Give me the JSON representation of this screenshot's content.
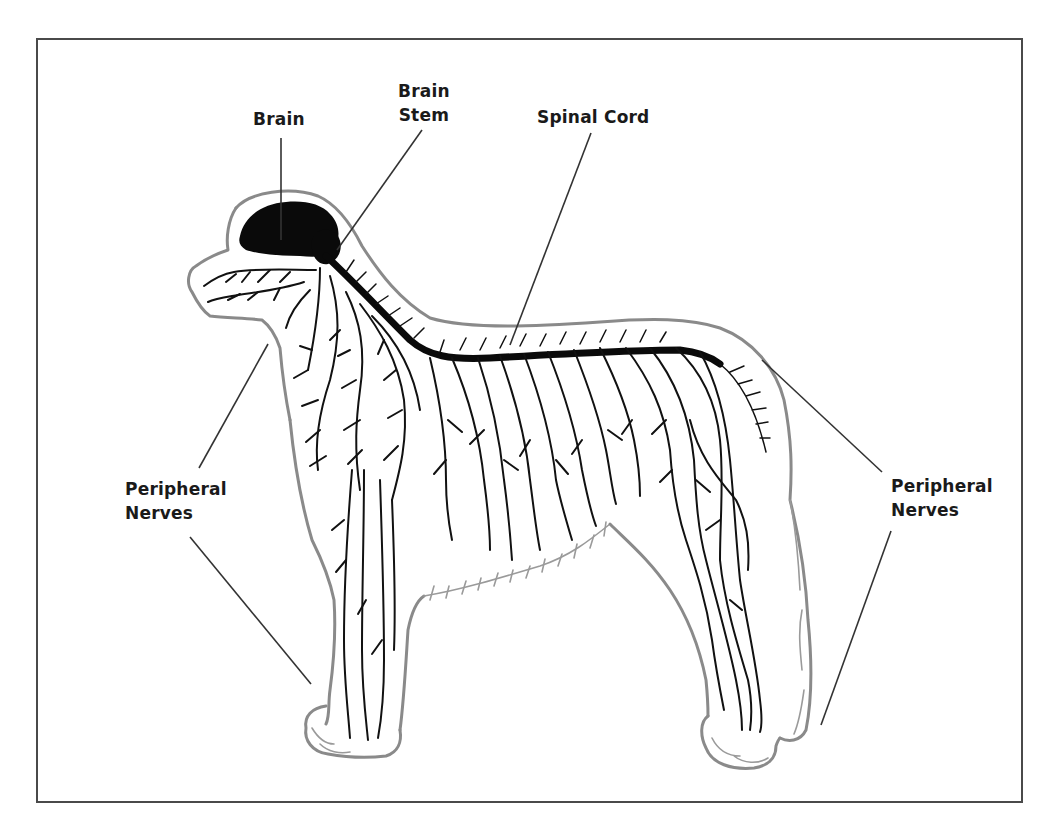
{
  "diagram": {
    "colors": {
      "frame": "#4a4a4a",
      "outline": "#8a8a8a",
      "nerves": "#111111",
      "brain": "#0a0a0a",
      "label_text": "#1a1a1a",
      "background": "#ffffff"
    },
    "labels": {
      "brain": "Brain",
      "brain_stem_line1": "Brain",
      "brain_stem_line2": "Stem",
      "spinal_cord": "Spinal Cord",
      "peripheral_left_line1": "Peripheral",
      "peripheral_left_line2": "Nerves",
      "peripheral_right_line1": "Peripheral",
      "peripheral_right_line2": "Nerves"
    },
    "leaders": [
      {
        "label": "Brain",
        "from": [
          281,
          138
        ],
        "to": [
          281,
          240
        ]
      },
      {
        "label": "Brain Stem",
        "from": [
          422,
          130
        ],
        "to": [
          337,
          250
        ]
      },
      {
        "label": "Spinal Cord",
        "from": [
          591,
          133
        ],
        "to": [
          510,
          345
        ]
      },
      {
        "label": "Peripheral Nerves (left, upper)",
        "from": [
          268,
          344
        ],
        "to": [
          199,
          468
        ]
      },
      {
        "label": "Peripheral Nerves (left, lower)",
        "from": [
          190,
          537
        ],
        "to": [
          311,
          684
        ]
      },
      {
        "label": "Peripheral Nerves (right, upper)",
        "from": [
          762,
          360
        ],
        "to": [
          882,
          472
        ]
      },
      {
        "label": "Peripheral Nerves (right, lower)",
        "from": [
          891,
          531
        ],
        "to": [
          821,
          725
        ]
      }
    ]
  }
}
